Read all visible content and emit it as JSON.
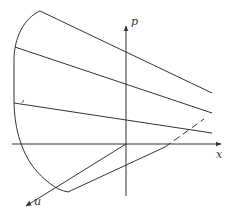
{
  "figure": {
    "type": "3d-axes-diagram",
    "background": "#ffffff",
    "stroke_color": "#333333",
    "axes": {
      "x": {
        "label": "x"
      },
      "p": {
        "label": "p"
      },
      "u": {
        "label": "u"
      }
    },
    "elements": [
      "boundary-curve",
      "upper-line-1",
      "upper-line-2",
      "upper-line-3-with-tick",
      "lower-line",
      "dashed-continuation"
    ]
  }
}
